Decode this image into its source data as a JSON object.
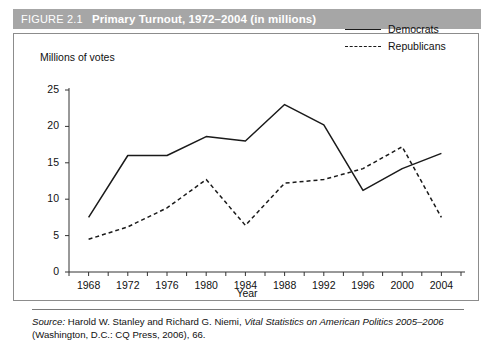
{
  "figure": {
    "number_label": "FIGURE 2.1",
    "title": "Primary Turnout, 1972–2004 (in millions)",
    "titlebar_color": "#a6a6a6",
    "title_text_color": "#ffffff"
  },
  "source_note": {
    "label": "Source:",
    "text_part1": " Harold W. Stanley and Richard G. Niemi, ",
    "italic_title": "Vital Statistics on American Politics 2005–2006",
    "text_part2": " (Washington, D.C.: CQ Press, 2006), 66."
  },
  "chart_data": {
    "type": "line",
    "title": "Primary Turnout, 1972–2004 (in millions)",
    "xlabel": "Year",
    "ylabel": "Millions of votes",
    "x": [
      1968,
      1972,
      1976,
      1980,
      1984,
      1988,
      1992,
      1996,
      2000,
      2004
    ],
    "xticks": [
      "1968",
      "1972",
      "1976",
      "1980",
      "1984",
      "1988",
      "1992",
      "1996",
      "2000",
      "2004"
    ],
    "yticks": [
      "0",
      "5",
      "10",
      "15",
      "20",
      "25"
    ],
    "ylim": [
      0,
      25
    ],
    "xlim": [
      1966,
      2006
    ],
    "grid": false,
    "legend_position": "top-right",
    "series": [
      {
        "name": "Democrats",
        "style": "solid",
        "color": "#1a1a1a",
        "values": [
          7.5,
          16.0,
          16.0,
          18.6,
          18.0,
          23.0,
          20.2,
          11.2,
          14.2,
          16.3
        ]
      },
      {
        "name": "Republicans",
        "style": "dashed",
        "color": "#1a1a1a",
        "values": [
          4.5,
          6.2,
          8.8,
          12.7,
          6.4,
          12.2,
          12.7,
          14.2,
          17.2,
          7.5
        ]
      }
    ]
  }
}
